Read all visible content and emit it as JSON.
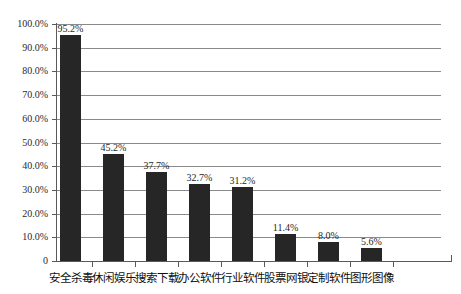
{
  "chart_data": {
    "type": "bar",
    "title": "",
    "subtitle": "",
    "xlabel": "",
    "ylabel": "",
    "ylim": [
      0,
      100
    ],
    "grid": true,
    "legend": false,
    "legend_position": "none",
    "units": "percent",
    "categories": [
      "安全杀毒",
      "休闲娱乐",
      "搜索下载",
      "办公软件",
      "行业软件",
      "股票网银",
      "定制软件",
      "图形图像"
    ],
    "values": [
      95.2,
      45.2,
      37.7,
      32.7,
      31.2,
      11.4,
      8.0,
      5.6
    ],
    "value_labels": [
      "95.2%",
      "45.2%",
      "37.7%",
      "32.7%",
      "31.2%",
      "11.4%",
      "8.0%",
      "5.6%"
    ],
    "ytick_values": [
      100,
      90,
      80,
      70,
      60,
      50,
      40,
      30,
      20,
      10,
      0
    ],
    "ytick_labels": [
      "100.0%",
      "90.0%",
      "80.0%",
      "70.0%",
      "60.0%",
      "50.0%",
      "40.0%",
      "30.0%",
      "20.0%",
      "10.0%",
      "0"
    ],
    "bar_color": "#262626",
    "grid_color": "#8a8a8a",
    "axis_color": "#5a5a5a",
    "background_color": "#ffffff"
  }
}
